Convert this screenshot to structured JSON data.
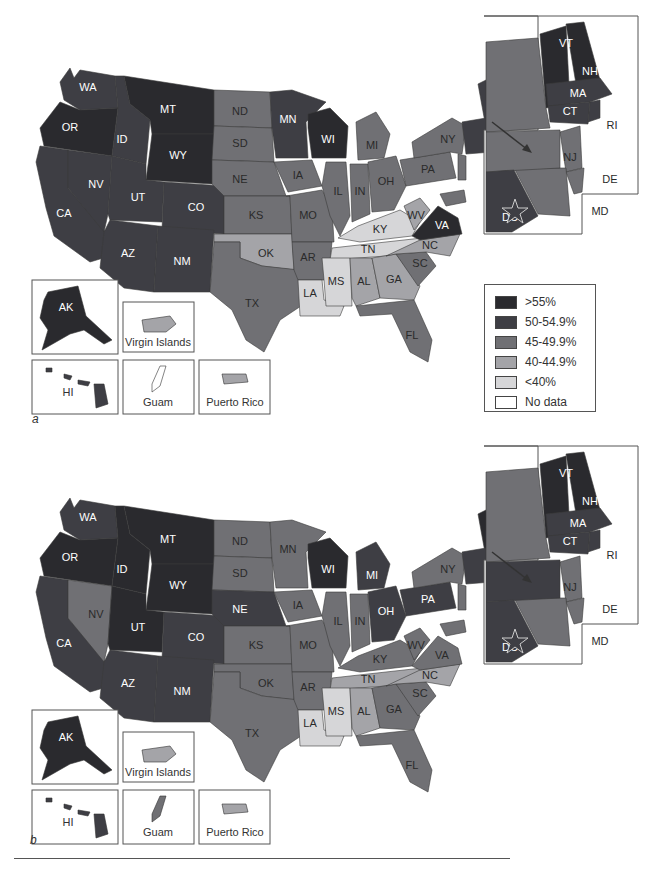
{
  "legend": {
    "items": [
      {
        "label": ">55%",
        "color": "#2a2a2e"
      },
      {
        "label": "50-54.9%",
        "color": "#3e3e44"
      },
      {
        "label": "45-49.9%",
        "color": "#707074"
      },
      {
        "label": "40-44.9%",
        "color": "#a4a4a8"
      },
      {
        "label": "<40%",
        "color": "#d6d6d8"
      },
      {
        "label": "No data",
        "color": "#ffffff"
      }
    ]
  },
  "territories": {
    "ak": "AK",
    "hi": "HI",
    "vi": "Virgin Islands",
    "gu": "Guam",
    "pr": "Puerto Rico"
  },
  "panels": {
    "a": {
      "letter": "a",
      "states": {
        "WA": "50-54.9%",
        "OR": ">55%",
        "CA": "50-54.9%",
        "NV": "50-54.9%",
        "ID": "50-54.9%",
        "MT": ">55%",
        "WY": ">55%",
        "UT": "50-54.9%",
        "AZ": "50-54.9%",
        "CO": "50-54.9%",
        "NM": "50-54.9%",
        "ND": "45-49.9%",
        "SD": "45-49.9%",
        "NE": "45-49.9%",
        "KS": "45-49.9%",
        "OK": "40-44.9%",
        "TX": "45-49.9%",
        "MN": "50-54.9%",
        "IA": "45-49.9%",
        "MO": "45-49.9%",
        "AR": "45-49.9%",
        "LA": "<40%",
        "WI": ">55%",
        "IL": "45-49.9%",
        "MI": "45-49.9%",
        "IN": "45-49.9%",
        "OH": "45-49.9%",
        "KY": "<40%",
        "TN": "<40%",
        "MS": "<40%",
        "AL": "40-44.9%",
        "GA": "40-44.9%",
        "FL": "45-49.9%",
        "SC": "45-49.9%",
        "NC": "40-44.9%",
        "VA": ">55%",
        "WV": "40-44.9%",
        "PA": "45-49.9%",
        "NY": "45-49.9%",
        "ME": "50-54.9%",
        "VT": ">55%",
        "NH": ">55%",
        "MA": "50-54.9%",
        "CT": "50-54.9%",
        "RI": "50-54.9%",
        "NJ": "45-49.9%",
        "DE": "45-49.9%",
        "MD": "45-49.9%",
        "DC": "50-54.9%",
        "AK": ">55%",
        "HI": "50-54.9%",
        "VI": "40-44.9%",
        "GU": "No data",
        "PR": "40-44.9%"
      }
    },
    "b": {
      "letter": "b",
      "states": {
        "WA": "50-54.9%",
        "OR": ">55%",
        "CA": "50-54.9%",
        "NV": "45-49.9%",
        "ID": ">55%",
        "MT": ">55%",
        "WY": ">55%",
        "UT": ">55%",
        "AZ": "50-54.9%",
        "CO": "50-54.9%",
        "NM": "50-54.9%",
        "ND": "45-49.9%",
        "SD": "45-49.9%",
        "NE": "50-54.9%",
        "KS": "45-49.9%",
        "OK": "45-49.9%",
        "TX": "45-49.9%",
        "MN": "45-49.9%",
        "IA": "45-49.9%",
        "MO": "45-49.9%",
        "AR": "45-49.9%",
        "LA": "<40%",
        "WI": ">55%",
        "IL": "45-49.9%",
        "MI": "50-54.9%",
        "IN": "45-49.9%",
        "OH": "50-54.9%",
        "KY": "45-49.9%",
        "TN": "40-44.9%",
        "MS": "<40%",
        "AL": "40-44.9%",
        "GA": "45-49.9%",
        "FL": "45-49.9%",
        "SC": "45-49.9%",
        "NC": "40-44.9%",
        "VA": "45-49.9%",
        "WV": "45-49.9%",
        "PA": "50-54.9%",
        "NY": "45-49.9%",
        "ME": ">55%",
        "VT": ">55%",
        "NH": ">55%",
        "MA": "50-54.9%",
        "CT": "50-54.9%",
        "RI": "50-54.9%",
        "NJ": "45-49.9%",
        "DE": "45-49.9%",
        "MD": "45-49.9%",
        "DC": "50-54.9%",
        "AK": ">55%",
        "HI": "50-54.9%",
        "VI": "40-44.9%",
        "GU": "45-49.9%",
        "PR": "40-44.9%"
      }
    }
  }
}
